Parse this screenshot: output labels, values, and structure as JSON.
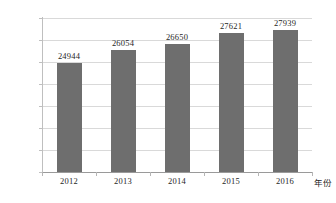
{
  "chart_data": {
    "type": "bar",
    "title": "",
    "xlabel": "年份",
    "ylabel": "",
    "categories": [
      "2012",
      "2013",
      "2014",
      "2015",
      "2016"
    ],
    "values": [
      24944,
      26054,
      26650,
      27621,
      27939
    ],
    "data_labels": [
      "24944",
      "26054",
      "26650",
      "27621",
      "27939"
    ],
    "ylim": [
      15000,
      29000
    ],
    "ytick_step": 2000,
    "ytick_labels": [
      "29000",
      "27000",
      "25000",
      "23000",
      "21000",
      "19000",
      "17000",
      "15000"
    ],
    "grid": true,
    "legend": false,
    "bar_color": "#6e6e6e",
    "grid_color": "#d9d9d9",
    "axis_color": "#9a9a9a",
    "background": "#ffffff"
  }
}
